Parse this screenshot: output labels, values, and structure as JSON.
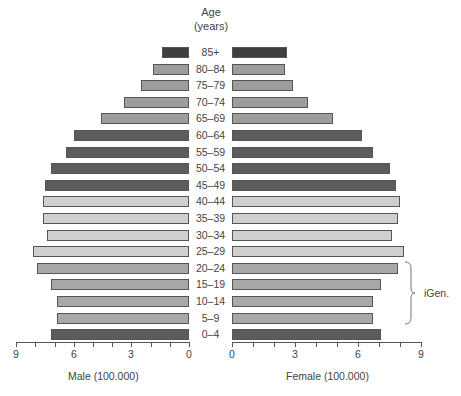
{
  "chart_data": {
    "type": "bar",
    "subtype": "population-pyramid",
    "title": "Age (years)",
    "title_line1": "Age",
    "title_line2": "(years)",
    "categories": [
      "85+",
      "80–84",
      "75–79",
      "70–74",
      "65–69",
      "60–64",
      "55–59",
      "50–54",
      "45–49",
      "40–44",
      "35–39",
      "30–34",
      "25–29",
      "20–24",
      "15–19",
      "10–14",
      "5–9",
      "0–4"
    ],
    "series": [
      {
        "name": "Male (100.000)",
        "side": "left",
        "values": [
          1.4,
          1.9,
          2.5,
          3.4,
          4.6,
          6.0,
          6.4,
          7.2,
          7.5,
          7.6,
          7.6,
          7.4,
          8.1,
          7.9,
          7.2,
          6.9,
          6.9,
          7.2
        ]
      },
      {
        "name": "Female (100.000)",
        "side": "right",
        "values": [
          2.6,
          2.5,
          2.9,
          3.6,
          4.8,
          6.2,
          6.7,
          7.5,
          7.8,
          8.0,
          7.9,
          7.6,
          8.2,
          7.9,
          7.1,
          6.7,
          6.7,
          7.1
        ]
      }
    ],
    "row_shades": [
      "darkest",
      "medium",
      "medium",
      "medium",
      "medium",
      "dark",
      "dark",
      "dark",
      "dark",
      "light",
      "light",
      "light",
      "light",
      "mid",
      "mid",
      "mid",
      "mid",
      "dark"
    ],
    "shade_colors": {
      "darkest": "#3f3f3f",
      "dark": "#5c5c5c",
      "medium": "#9d9d9d",
      "mid": "#a8a8a8",
      "light": "#cfcfcf"
    },
    "xlabel_left": "Male (100.000)",
    "xlabel_right": "Female (100.000)",
    "xticks_left": [
      "9",
      "6",
      "3",
      "0"
    ],
    "xticks_right": [
      "0",
      "3",
      "6",
      "9"
    ],
    "xlim": [
      0,
      9
    ],
    "grid": false,
    "annotations": [
      {
        "text": "iGen.",
        "type": "brace",
        "spans": [
          "20–24",
          "5–9"
        ],
        "side": "right"
      }
    ]
  }
}
